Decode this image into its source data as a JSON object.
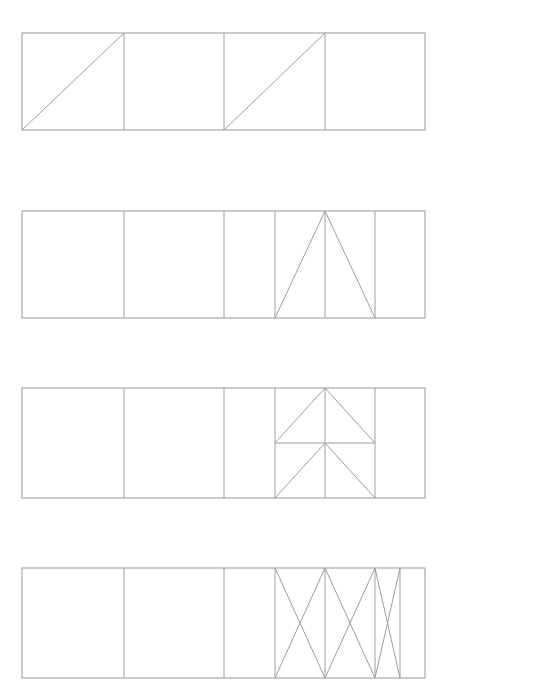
{
  "document": {
    "title": "Geometric Subdivision Figure",
    "background_color": "#ffffff",
    "line_color": "#9a9a9a",
    "canvas_width": 549,
    "canvas_height": 698,
    "description": "Four horizontal banded rectangles, each subdivided by vertical lines, with progressively more complex triangular / X cross-hatch motifs filling the right-hand cells."
  },
  "geometry": {
    "left": 22,
    "right": 425,
    "width": 403
  },
  "rows": [
    {
      "index": 1,
      "name": "row-diagonals",
      "label": "Row 1 - paired rising diagonals",
      "top": 33,
      "bottom": 130,
      "verticals": [
        124,
        224,
        325
      ],
      "shapes": [
        {
          "type": "line",
          "name": "diagonal-cell-1",
          "x1": 22,
          "y1": 130,
          "x2": 124,
          "y2": 33
        },
        {
          "type": "line",
          "name": "diagonal-cell-3",
          "x1": 224,
          "y1": 130,
          "x2": 325,
          "y2": 33
        }
      ]
    },
    {
      "index": 2,
      "name": "row-apex-triangle",
      "label": "Row 2 - wide isoceles apex triangle",
      "top": 211,
      "bottom": 318,
      "verticals": [
        124,
        224,
        275,
        325,
        375
      ],
      "shapes": [
        {
          "type": "line",
          "name": "triangle-left-leg",
          "x1": 275,
          "y1": 318,
          "x2": 325,
          "y2": 211
        },
        {
          "type": "line",
          "name": "triangle-right-leg",
          "x1": 375,
          "y1": 318,
          "x2": 325,
          "y2": 211
        }
      ]
    },
    {
      "index": 3,
      "name": "row-arrow-stack",
      "label": "Row 3 - stacked triangle over inverted chevron",
      "top": 388,
      "bottom": 498,
      "verticals": [
        124,
        224,
        275,
        325,
        375
      ],
      "midline_y": 443,
      "shapes": [
        {
          "type": "line",
          "name": "upper-triangle-left-leg",
          "x1": 275,
          "y1": 443,
          "x2": 325,
          "y2": 388
        },
        {
          "type": "line",
          "name": "upper-triangle-right-leg",
          "x1": 375,
          "y1": 443,
          "x2": 325,
          "y2": 388
        },
        {
          "type": "line",
          "name": "midline-horizontal",
          "x1": 275,
          "y1": 443,
          "x2": 375,
          "y2": 443
        },
        {
          "type": "line",
          "name": "lower-chevron-left-leg",
          "x1": 275,
          "y1": 498,
          "x2": 325,
          "y2": 443
        },
        {
          "type": "line",
          "name": "lower-chevron-right-leg",
          "x1": 375,
          "y1": 498,
          "x2": 325,
          "y2": 443
        }
      ]
    },
    {
      "index": 4,
      "name": "row-crossed-cells",
      "label": "Row 4 - repeated X cross-braced cells",
      "top": 568,
      "bottom": 678,
      "verticals": [
        124,
        224,
        275,
        325,
        375,
        400
      ],
      "shapes": [
        {
          "type": "line",
          "name": "cross-a-down",
          "x1": 275,
          "y1": 568,
          "x2": 325,
          "y2": 678
        },
        {
          "type": "line",
          "name": "cross-a-up",
          "x1": 275,
          "y1": 678,
          "x2": 325,
          "y2": 568
        },
        {
          "type": "line",
          "name": "cross-b-down",
          "x1": 325,
          "y1": 568,
          "x2": 375,
          "y2": 678
        },
        {
          "type": "line",
          "name": "cross-b-up",
          "x1": 325,
          "y1": 678,
          "x2": 375,
          "y2": 568
        },
        {
          "type": "line",
          "name": "cross-c-down",
          "x1": 375,
          "y1": 568,
          "x2": 400,
          "y2": 678
        },
        {
          "type": "line",
          "name": "cross-c-up",
          "x1": 375,
          "y1": 678,
          "x2": 400,
          "y2": 568
        }
      ]
    }
  ]
}
